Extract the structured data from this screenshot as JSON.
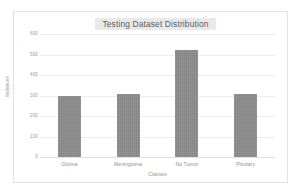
{
  "chart_data": {
    "type": "bar",
    "title": "Testing Dataset Distribution",
    "xlabel": "Classes",
    "ylabel": "Instances",
    "categories": [
      "Glioma",
      "Meningioma",
      "No Tumor",
      "Pituitary"
    ],
    "values": [
      300,
      306,
      520,
      306
    ],
    "ylim": [
      0,
      600
    ],
    "yticks": [
      0,
      100,
      200,
      300,
      400,
      500,
      600
    ],
    "ytick_labels": [
      "0",
      "100",
      "200",
      "300",
      "400",
      "500",
      "600"
    ],
    "grid": "horizontal",
    "legend": "none",
    "series": [
      {
        "name": "Instances",
        "values": [
          300,
          306,
          520,
          306
        ],
        "color": "#828282"
      }
    ],
    "style": {
      "bar_color": "#828282",
      "gridline_color": "#ededed",
      "frame_color": "#e2e2e2",
      "title_highlight_color": "#e9e9e9",
      "tick_text_color": "#9a9a9a",
      "background_color": "#ffffff"
    }
  }
}
